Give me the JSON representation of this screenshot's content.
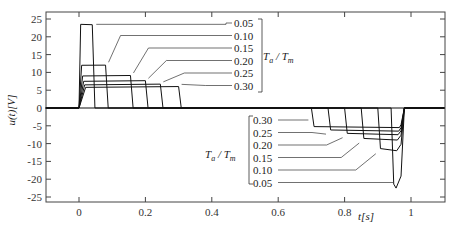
{
  "chart_data": {
    "type": "line",
    "title": "",
    "xlabel": "t[s]",
    "ylabel": "u(t)[V]",
    "xlim": [
      -0.1,
      1.1
    ],
    "ylim": [
      -27,
      27
    ],
    "x_ticks": [
      "0",
      "0.2",
      "0.4",
      "0.6",
      "0.8",
      "1"
    ],
    "x_tick_values": [
      0,
      0.2,
      0.4,
      0.6,
      0.8,
      1.0
    ],
    "y_ticks": [
      "25",
      "20",
      "15",
      "10",
      "5",
      "0",
      "-5",
      "-10",
      "-15",
      "-20",
      "-25"
    ],
    "y_tick_values": [
      25,
      20,
      15,
      10,
      5,
      0,
      -5,
      -10,
      -15,
      -20,
      -25
    ],
    "grid": false,
    "legend_group_label": "Ta / Tm",
    "series": [
      {
        "name": "0.05",
        "accel": {
          "t_start": 0.0,
          "t_end": 0.04,
          "u": 23.5
        },
        "decel": {
          "t_start": 0.94,
          "t_end": 1.0,
          "u": -22.5
        }
      },
      {
        "name": "0.10",
        "accel": {
          "t_start": 0.0,
          "t_end": 0.08,
          "u": 12.0
        },
        "decel": {
          "t_start": 0.9,
          "t_end": 1.0,
          "u": -12.0
        }
      },
      {
        "name": "0.15",
        "accel": {
          "t_start": 0.0,
          "t_end": 0.155,
          "u": 9.0
        },
        "decel": {
          "t_start": 0.85,
          "t_end": 1.0,
          "u": -9.0
        }
      },
      {
        "name": "0.20",
        "accel": {
          "t_start": 0.0,
          "t_end": 0.2,
          "u": 7.5
        },
        "decel": {
          "t_start": 0.8,
          "t_end": 1.0,
          "u": -7.5
        }
      },
      {
        "name": "0.25",
        "accel": {
          "t_start": 0.0,
          "t_end": 0.245,
          "u": 6.5
        },
        "decel": {
          "t_start": 0.75,
          "t_end": 1.0,
          "u": -6.5
        }
      },
      {
        "name": "0.30",
        "accel": {
          "t_start": 0.0,
          "t_end": 0.3,
          "u": 5.8
        },
        "decel": {
          "t_start": 0.7,
          "t_end": 1.0,
          "u": -5.5
        }
      }
    ],
    "annotations": {
      "upper_labels": [
        "0.05",
        "0.10",
        "0.15",
        "0.20",
        "0.25",
        "0.30"
      ],
      "lower_labels": [
        "0.30",
        "0.25",
        "0.20",
        "0.15",
        "0.10",
        "0.05"
      ],
      "group_label_upper": "Ta / Tm",
      "group_label_lower": "Ta / Tm"
    }
  }
}
